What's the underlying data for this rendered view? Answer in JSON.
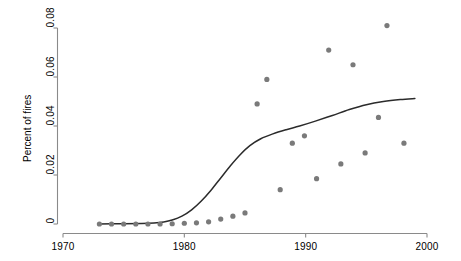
{
  "chart_data": {
    "type": "scatter",
    "title": "",
    "xlabel": "",
    "ylabel": "Percent of fires",
    "xlim": [
      1968.5,
      2001.5
    ],
    "ylim": [
      -0.004,
      0.088
    ],
    "grid": false,
    "legend": "none",
    "x_ticks": [
      1970,
      1980,
      1990,
      2000
    ],
    "x_tick_labels": [
      "1970",
      "1980",
      "1990",
      "2000"
    ],
    "y_ticks": [
      0,
      0.02,
      0.04,
      0.06,
      0.08
    ],
    "y_tick_labels": [
      "0",
      "0.02",
      "0.04",
      "0.06",
      "0.08"
    ],
    "marker_color": "#7a7a7a",
    "line_color": "#2b2b2b",
    "axis_color": "#8a8a8a",
    "series": [
      {
        "name": "Percent of fires",
        "type": "scatter",
        "points": [
          [
            1973.0,
            0.0
          ],
          [
            1974.0,
            0.0
          ],
          [
            1975.0,
            0.0
          ],
          [
            1976.0,
            0.0
          ],
          [
            1977.0,
            0.0
          ],
          [
            1978.0,
            0.0
          ],
          [
            1979.0,
            0.0001
          ],
          [
            1980.0,
            0.0003
          ],
          [
            1981.0,
            0.0005
          ],
          [
            1982.0,
            0.0009
          ],
          [
            1983.0,
            0.002
          ],
          [
            1984.0,
            0.0032
          ],
          [
            1985.0,
            0.0045
          ],
          [
            1986.0,
            0.049
          ],
          [
            1986.8,
            0.059
          ],
          [
            1987.9,
            0.014
          ],
          [
            1988.9,
            0.033
          ],
          [
            1989.9,
            0.036
          ],
          [
            1990.9,
            0.0185
          ],
          [
            1991.9,
            0.071
          ],
          [
            1992.9,
            0.0245
          ],
          [
            1993.9,
            0.065
          ],
          [
            1994.9,
            0.029
          ],
          [
            1996.0,
            0.0435
          ],
          [
            1996.7,
            0.081
          ],
          [
            1998.1,
            0.033
          ]
        ]
      },
      {
        "name": "Smoothed trend",
        "type": "line",
        "points": [
          [
            1973.0,
            0.0
          ],
          [
            1975.0,
            0.0001
          ],
          [
            1976.5,
            0.0002
          ],
          [
            1977.5,
            0.0004
          ],
          [
            1978.3,
            0.0008
          ],
          [
            1979.0,
            0.0016
          ],
          [
            1979.8,
            0.0032
          ],
          [
            1980.6,
            0.0058
          ],
          [
            1981.4,
            0.0094
          ],
          [
            1982.2,
            0.0138
          ],
          [
            1983.0,
            0.0188
          ],
          [
            1983.8,
            0.0238
          ],
          [
            1984.6,
            0.0283
          ],
          [
            1985.4,
            0.032
          ],
          [
            1986.3,
            0.0348
          ],
          [
            1987.3,
            0.0368
          ],
          [
            1988.4,
            0.0385
          ],
          [
            1989.5,
            0.04
          ],
          [
            1990.8,
            0.042
          ],
          [
            1992.2,
            0.0443
          ],
          [
            1993.6,
            0.0467
          ],
          [
            1995.0,
            0.0487
          ],
          [
            1996.4,
            0.05
          ],
          [
            1997.8,
            0.0508
          ],
          [
            1999.0,
            0.0512
          ]
        ]
      }
    ]
  },
  "axes": {
    "y_title": "Percent of fires"
  }
}
